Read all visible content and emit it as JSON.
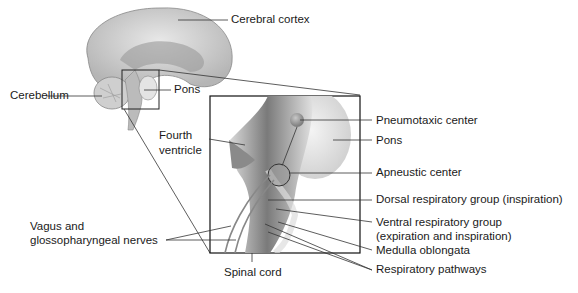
{
  "labels": {
    "cerebral_cortex": "Cerebral cortex",
    "cerebellum": "Cerebellum",
    "pons_small": "Pons",
    "fourth_ventricle_1": "Fourth",
    "fourth_ventricle_2": "ventricle",
    "pneumotaxic_center": "Pneumotaxic center",
    "pons_large": "Pons",
    "apneustic_center": "Apneustic center",
    "dorsal_group": "Dorsal respiratory group (inspiration)",
    "ventral_group_1": "Ventral respiratory group",
    "ventral_group_2": "(expiration and inspiration)",
    "medulla": "Medulla oblongata",
    "resp_pathways": "Respiratory pathways",
    "vagus_1": "Vagus and",
    "vagus_2": "glossopharyngeal nerves",
    "spinal_cord": "Spinal cord"
  }
}
